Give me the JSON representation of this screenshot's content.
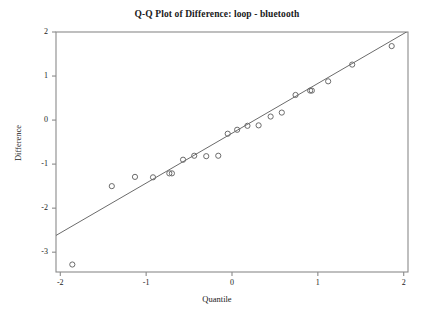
{
  "chart_data": {
    "type": "scatter",
    "title": "Q-Q Plot of Difference: loop - bluetooth",
    "xlabel": "Quantile",
    "ylabel": "Difference",
    "xlim": [
      -2.05,
      2.05
    ],
    "ylim": [
      -3.45,
      2.0
    ],
    "grid": false,
    "legend": null,
    "xticks": [
      -2,
      -1,
      0,
      1,
      2
    ],
    "xtick_labels": [
      "-2",
      "-1",
      "0",
      "1",
      "2"
    ],
    "yticks": [
      2,
      1,
      0,
      -1,
      -2,
      -3
    ],
    "ytick_labels": [
      "2",
      "1",
      "0",
      "-1",
      "-2",
      "-3"
    ],
    "marker": "open-circle",
    "marker_color": "#6b6b6b",
    "line_color": "#6b6b6b",
    "frame_color": "#8a8a8a",
    "background": "#ffffff",
    "reference_line": {
      "label": "normal reference line",
      "x_start": -2.05,
      "y_start": -2.62,
      "x_end": 2.05,
      "y_end": 2.02
    },
    "points": [
      {
        "x": -1.86,
        "y": -3.28
      },
      {
        "x": -1.4,
        "y": -1.5
      },
      {
        "x": -1.13,
        "y": -1.29
      },
      {
        "x": -0.92,
        "y": -1.3
      },
      {
        "x": -0.73,
        "y": -1.21
      },
      {
        "x": -0.7,
        "y": -1.21
      },
      {
        "x": -0.57,
        "y": -0.9
      },
      {
        "x": -0.44,
        "y": -0.81
      },
      {
        "x": -0.3,
        "y": -0.82
      },
      {
        "x": -0.16,
        "y": -0.81
      },
      {
        "x": -0.05,
        "y": -0.31
      },
      {
        "x": 0.06,
        "y": -0.22
      },
      {
        "x": 0.18,
        "y": -0.13
      },
      {
        "x": 0.31,
        "y": -0.12
      },
      {
        "x": 0.45,
        "y": 0.08
      },
      {
        "x": 0.58,
        "y": 0.17
      },
      {
        "x": 0.74,
        "y": 0.57
      },
      {
        "x": 0.91,
        "y": 0.67
      },
      {
        "x": 0.93,
        "y": 0.67
      },
      {
        "x": 1.12,
        "y": 0.88
      },
      {
        "x": 1.4,
        "y": 1.26
      },
      {
        "x": 1.86,
        "y": 1.68
      }
    ]
  }
}
